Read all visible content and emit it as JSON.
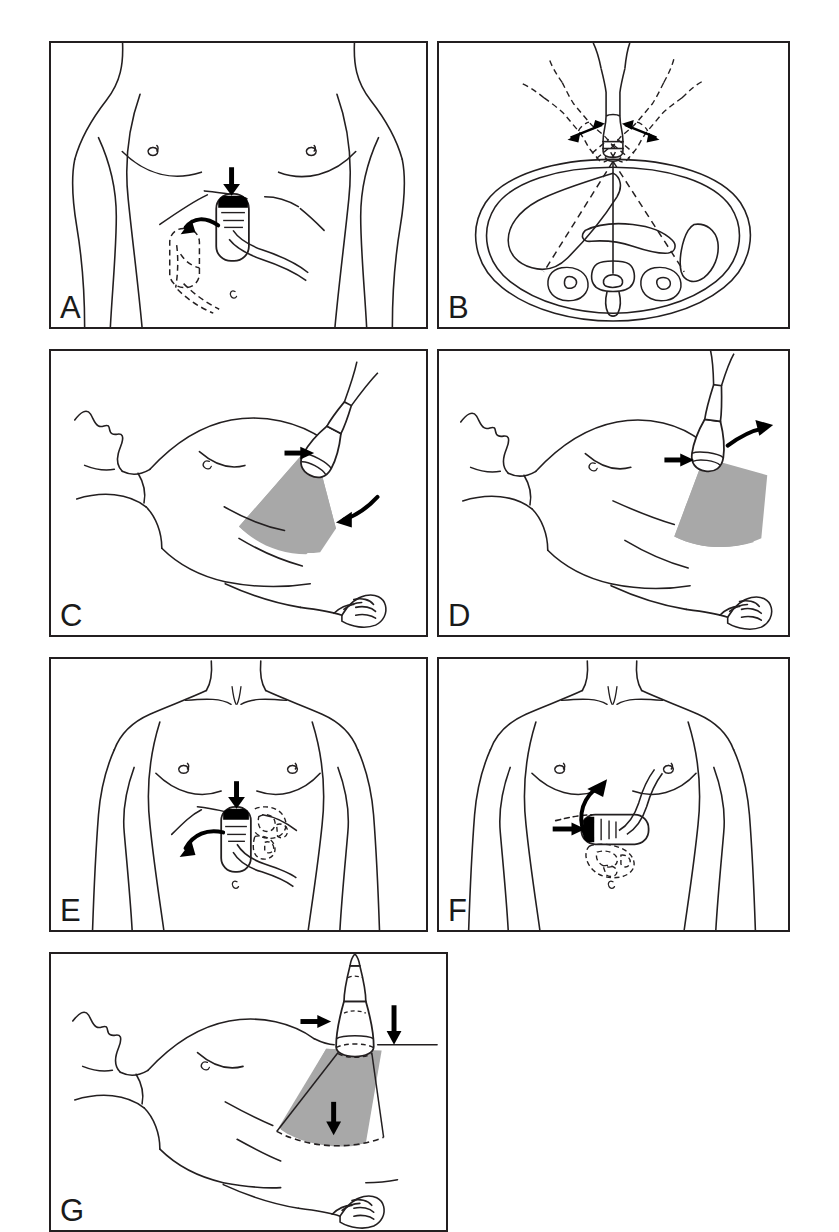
{
  "figure": {
    "kind": "medical-illustration",
    "panel_count": 7,
    "background_color": "#ffffff",
    "ink_color": "#231f20",
    "sector_fill_color": "#a8a8a8",
    "marker_color": "#000000"
  },
  "panels": [
    {
      "id": "a",
      "label": "A",
      "view": "anterior upper abdomen / chest, standing patient",
      "transducer": {
        "orientation": "vertical (sagittal / longitudinal)",
        "marker_position": "top",
        "cable_direction": "lower-right"
      },
      "annotations": [
        {
          "type": "arrow-straight",
          "direction": "down",
          "meaning": "apply pressure / probe placement"
        },
        {
          "type": "arrow-curved",
          "direction": "down-left",
          "meaning": "slide probe toward left upper quadrant"
        },
        {
          "type": "dashed-outline",
          "meaning": "alternate / target probe position"
        }
      ]
    },
    {
      "id": "b",
      "label": "B",
      "view": "transverse abdominal cross-section",
      "transducer": {
        "orientation": "vertical, midline",
        "fan_angles_degrees": [
          -40,
          0,
          40
        ],
        "dashed_copies": 2
      },
      "anatomy": [
        "body wall",
        "liver",
        "pancreas",
        "spleen",
        "right kidney",
        "left kidney",
        "vertebral body"
      ],
      "annotations": [
        {
          "type": "arrow-double",
          "direction": "left",
          "meaning": "angulation range to patient left"
        },
        {
          "type": "arrow-double",
          "direction": "right",
          "meaning": "angulation range to patient right"
        },
        {
          "type": "beam-line",
          "style": "solid",
          "meaning": "central beam axis"
        },
        {
          "type": "beam-line",
          "style": "dashed",
          "meaning": "angled beam axes"
        }
      ]
    },
    {
      "id": "c",
      "label": "C",
      "view": "supine patient, lateral / subcostal approach",
      "transducer": {
        "orientation": "angled, pointing up-right",
        "scan_sector": "fan, shaded gray, directed inferomedially"
      },
      "annotations": [
        {
          "type": "arrow-straight",
          "direction": "right",
          "meaning": "press probe toward patient"
        },
        {
          "type": "arrow-curved",
          "direction": "down-left",
          "meaning": "rock / angle probe caudally"
        }
      ]
    },
    {
      "id": "d",
      "label": "D",
      "view": "supine patient, lateral / subcostal approach",
      "transducer": {
        "orientation": "near vertical",
        "scan_sector": "fan, shaded gray, directed inferolaterally"
      },
      "annotations": [
        {
          "type": "arrow-straight",
          "direction": "right",
          "meaning": "press probe toward patient"
        },
        {
          "type": "arrow-curved",
          "direction": "up-right",
          "meaning": "rock / angle probe cranially"
        }
      ]
    },
    {
      "id": "e",
      "label": "E",
      "view": "anterior chest and upper abdomen, arms at side",
      "transducer": {
        "orientation": "vertical (sagittal / longitudinal)",
        "marker_position": "top",
        "cable_direction": "lower-right"
      },
      "annotations": [
        {
          "type": "arrow-straight",
          "direction": "down",
          "meaning": "apply pressure"
        },
        {
          "type": "arrow-curved",
          "direction": "down-left",
          "meaning": "sweep probe to patient right"
        },
        {
          "type": "dashed-cluster",
          "meaning": "bowel gas / obscuring structure"
        }
      ]
    },
    {
      "id": "f",
      "label": "F",
      "view": "anterior chest and upper abdomen, arms at side",
      "transducer": {
        "orientation": "horizontal (transverse)",
        "marker_position": "left end",
        "cable_direction": "upper-right"
      },
      "annotations": [
        {
          "type": "arrow-straight",
          "direction": "right",
          "meaning": "apply pressure toward midline"
        },
        {
          "type": "arrow-curved",
          "direction": "up",
          "meaning": "sweep probe cranially"
        },
        {
          "type": "dashed-cluster",
          "meaning": "bowel gas / obscuring structure"
        }
      ]
    },
    {
      "id": "g",
      "label": "G",
      "view": "supine patient, graded compression technique",
      "transducer": {
        "orientation": "vertical",
        "scan_sector": "fan, shaded gray with dashed pre-compression boundary"
      },
      "annotations": [
        {
          "type": "arrow-straight",
          "direction": "right",
          "meaning": "probe contact"
        },
        {
          "type": "arrow-straight",
          "direction": "down",
          "meaning": "graded compression"
        },
        {
          "type": "arrow-straight",
          "direction": "down",
          "meaning": "displaced deep boundary"
        },
        {
          "type": "dashed-outline",
          "meaning": "tissue position before compression"
        }
      ]
    }
  ]
}
